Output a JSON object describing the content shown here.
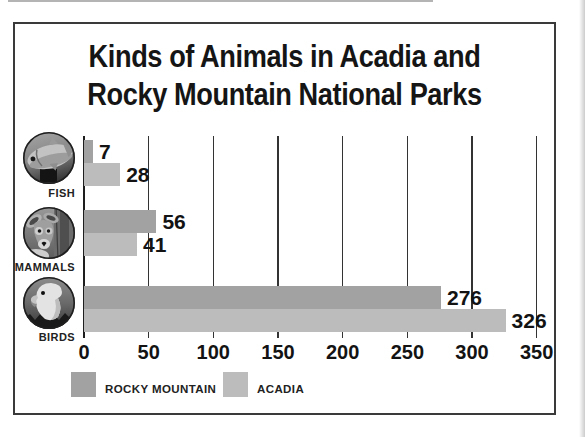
{
  "title": {
    "line1": "Kinds of Animals in Acadia and",
    "line2": "Rocky Mountain National Parks"
  },
  "chart_data": {
    "type": "bar",
    "orientation": "horizontal",
    "title": "Kinds of Animals in Acadia and Rocky Mountain National Parks",
    "categories": [
      "FISH",
      "MAMMALS",
      "BIRDS"
    ],
    "category_icons": [
      "fish-photo",
      "deer-photo",
      "eagle-photo"
    ],
    "series": [
      {
        "name": "ROCKY MOUNTAIN",
        "color": "#a2a2a2",
        "values": [
          7,
          56,
          276
        ]
      },
      {
        "name": "ACADIA",
        "color": "#bcbcbc",
        "values": [
          28,
          41,
          326
        ]
      }
    ],
    "xlim": [
      0,
      350
    ],
    "xticks": [
      0,
      50,
      100,
      150,
      200,
      250,
      300,
      350
    ],
    "grid": true,
    "value_labels": true,
    "legend_position": "bottom"
  },
  "colors": {
    "text": "#131313",
    "gridline": "#333333",
    "zero_axis": "#1e1e1e",
    "frame_border": "#3a3a3a",
    "background": "#ffffff"
  }
}
